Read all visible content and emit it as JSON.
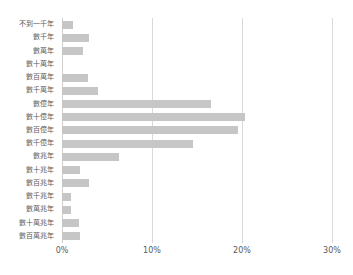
{
  "chart_data": {
    "type": "bar",
    "orientation": "horizontal",
    "title": "",
    "xlabel": "",
    "ylabel": "",
    "xlim": [
      0,
      30
    ],
    "xticks": [
      "0%",
      "10%",
      "20%",
      "30%"
    ],
    "xtick_values": [
      0,
      10,
      20,
      30
    ],
    "grid": true,
    "legend": "none",
    "bar_color": "#c6c6c6",
    "gridline_color": "#d9d9d9",
    "categories": [
      "不到一千年",
      "數千年",
      "數萬年",
      "數十萬年",
      "數百萬年",
      "數千萬年",
      "數億年",
      "數十億年",
      "數百億年",
      "數千億年",
      "數兆年",
      "數十兆年",
      "數百兆年",
      "數千兆年",
      "數萬兆年",
      "數十萬兆年",
      "數百萬兆年"
    ],
    "values": [
      1.2,
      3.0,
      2.3,
      0.0,
      2.9,
      4.0,
      16.5,
      20.3,
      19.5,
      14.6,
      6.3,
      2.0,
      3.0,
      1.0,
      1.0,
      1.9,
      2.0
    ]
  }
}
